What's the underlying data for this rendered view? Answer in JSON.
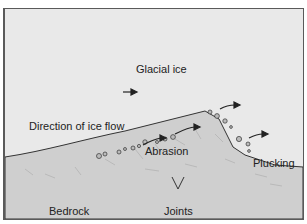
{
  "diagram": {
    "labels": {
      "ice": "Glacial ice",
      "flow": "Direction of ice flow",
      "abrasion": "Abrasion",
      "plucking": "Plucking",
      "bedrock": "Bedrock",
      "joints": "Joints"
    },
    "colors": {
      "ice": "#e9e9e9",
      "bedrock": "#cfcfcf",
      "outline": "#333333",
      "text": "#222222"
    }
  }
}
